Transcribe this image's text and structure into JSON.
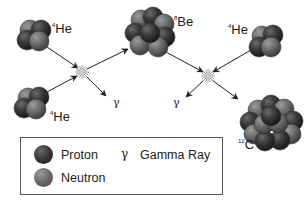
{
  "diagram": {
    "nuclei": [
      {
        "id": "he4-top-left",
        "mass_number": "4",
        "symbol": "He"
      },
      {
        "id": "he4-bottom-left",
        "mass_number": "4",
        "symbol": "He"
      },
      {
        "id": "be8",
        "mass_number": "8",
        "symbol": "Be"
      },
      {
        "id": "he4-top-right",
        "mass_number": "4",
        "symbol": "He"
      },
      {
        "id": "c12",
        "mass_number": "12",
        "symbol": "C"
      }
    ],
    "gamma_symbol": "γ",
    "reactions": [
      {
        "inputs": [
          "⁴He",
          "⁴He"
        ],
        "outputs": [
          "⁸Be",
          "γ"
        ]
      },
      {
        "inputs": [
          "⁸Be",
          "⁴He"
        ],
        "outputs": [
          "¹²C",
          "γ"
        ]
      }
    ]
  },
  "legend": {
    "proton_label": "Proton",
    "neutron_label": "Neutron",
    "gamma_symbol": "γ",
    "gamma_label": "Gamma Ray"
  },
  "colors": {
    "proton": "#2e2e2e",
    "neutron": "#6e6e6e",
    "arrow": "#222222",
    "background": "#ffffff"
  }
}
